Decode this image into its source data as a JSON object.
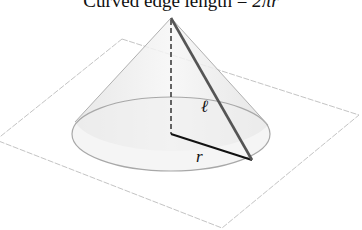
{
  "diagram": {
    "title_prefix": "Curved edge length = ",
    "title_math": "2πr",
    "labels": {
      "slant_height": "ℓ",
      "radius": "r"
    },
    "colors": {
      "plane_edge": "#bdbdbd",
      "cone_fill": "#ececec",
      "cone_outline": "#9a9a9a",
      "slant_line": "#555555",
      "radius_line": "#111111",
      "height_line": "#333333"
    }
  }
}
